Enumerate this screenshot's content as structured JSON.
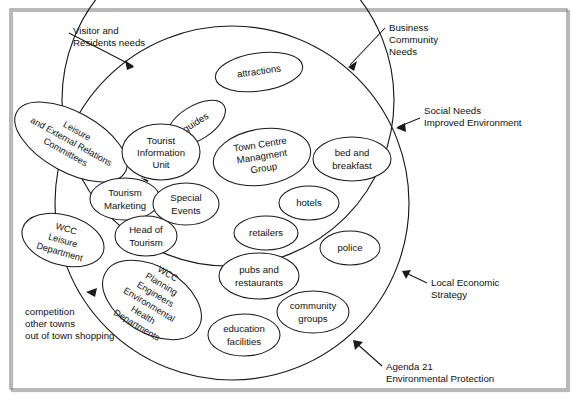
{
  "diagram": {
    "colors": {
      "stroke": "#1a1a1a",
      "fill": "#ffffff",
      "frame": "#8d8d8d",
      "text": "#111111"
    },
    "circles": [
      {
        "name": "outer-environment-circle",
        "label": ""
      },
      {
        "name": "inner-wcc-tourism-services-circle",
        "label": ""
      }
    ],
    "curved_label": "WCC Tourism Services",
    "nodes": [
      {
        "id": "attractions",
        "label": "attractions",
        "lines": [
          "attractions"
        ],
        "rotation": -8
      },
      {
        "id": "guides",
        "label": "guides",
        "lines": [
          "guides"
        ],
        "rotation": -32
      },
      {
        "id": "leisure-external-relations-committees",
        "label": "Leisure and External Relations Committees",
        "lines": [
          "Leisure",
          "and External Relations",
          "Committees"
        ],
        "rotation": 29
      },
      {
        "id": "tourist-information-unit",
        "label": "Tourist Information Unit",
        "lines": [
          "Tourist",
          "Information",
          "Unit"
        ],
        "rotation": 0
      },
      {
        "id": "town-centre-managment-group",
        "label": "Town Centre Managment Group",
        "lines": [
          "Town Centre",
          "Managment",
          "Group"
        ],
        "rotation": -9
      },
      {
        "id": "bed-and-breakfast",
        "label": "bed and breakfast",
        "lines": [
          "bed and",
          "breakfast"
        ],
        "rotation": 0
      },
      {
        "id": "tourism-marketing",
        "label": "Tourism Marketing",
        "lines": [
          "Tourism",
          "Marketing"
        ],
        "rotation": 0
      },
      {
        "id": "special-events",
        "label": "Special Events",
        "lines": [
          "Special",
          "Events"
        ],
        "rotation": 0
      },
      {
        "id": "hotels",
        "label": "hotels",
        "lines": [
          "hotels"
        ],
        "rotation": 0
      },
      {
        "id": "wcc-leisure-department",
        "label": "WCC Leisure Department",
        "lines": [
          "WCC",
          "Leisure",
          "Department"
        ],
        "rotation": 16
      },
      {
        "id": "head-of-tourism",
        "label": "Head of Tourism",
        "lines": [
          "Head of",
          "Tourism"
        ],
        "rotation": 0
      },
      {
        "id": "retailers",
        "label": "retailers",
        "lines": [
          "retailers"
        ],
        "rotation": 0
      },
      {
        "id": "police",
        "label": "police",
        "lines": [
          "police"
        ],
        "rotation": 0
      },
      {
        "id": "wcc-planning-engineers-environmental-health-departments",
        "label": "WCC Planning Engineers Environmental Health Departments",
        "lines": [
          "WCC",
          "Planning",
          "Engineers",
          "Environmental",
          "Health",
          "Departments"
        ],
        "rotation": 31
      },
      {
        "id": "pubs-and-restaurants",
        "label": "pubs and restaurants",
        "lines": [
          "pubs and",
          "restaurants"
        ],
        "rotation": 0
      },
      {
        "id": "community-groups",
        "label": "community groups",
        "lines": [
          "community",
          "groups"
        ],
        "rotation": 0
      },
      {
        "id": "education-facilities",
        "label": "education facilities",
        "lines": [
          "education",
          "facilities"
        ],
        "rotation": 0
      }
    ],
    "annotations": [
      {
        "id": "visitor-residents-needs",
        "lines": [
          "Visitor and",
          "Residents needs"
        ],
        "align": "left"
      },
      {
        "id": "business-community-needs",
        "lines": [
          "Business",
          "Community",
          "Needs"
        ],
        "align": "left"
      },
      {
        "id": "social-needs-improved-environment",
        "lines": [
          "Social Needs",
          " Improved Environment"
        ],
        "align": "left"
      },
      {
        "id": "local-economic-strategy",
        "lines": [
          "Local Economic",
          "Strategy"
        ],
        "align": "left"
      },
      {
        "id": "agenda-21-environmental-protection",
        "lines": [
          "Agenda 21",
          " Environmental Protection"
        ],
        "align": "left"
      },
      {
        "id": "competition-other-towns",
        "lines": [
          "competition",
          " other towns",
          " out of town shopping"
        ],
        "align": "left"
      }
    ]
  }
}
